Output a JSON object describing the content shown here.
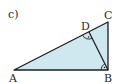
{
  "part_label": "c)",
  "figure": {
    "type": "right-triangle-with-altitude",
    "fill_color": "#cfe8ef",
    "stroke_color": "#1e1e1e",
    "vertices": {
      "A": {
        "label": "A",
        "x": 14,
        "y": 70
      },
      "B": {
        "label": "B",
        "x": 108,
        "y": 70
      },
      "C": {
        "label": "C",
        "x": 108,
        "y": 22
      },
      "D": {
        "label": "D",
        "x": 89,
        "y": 32
      }
    },
    "segments": [
      "AB",
      "BC",
      "CA",
      "DB"
    ],
    "right_angles": [
      "D",
      "B"
    ]
  }
}
